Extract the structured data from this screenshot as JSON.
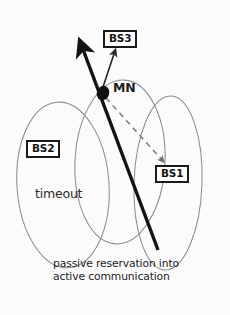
{
  "figure": {
    "type": "network-handover-diagram",
    "background_color": "#fbfbfb",
    "ink_color": "#1a1a1a",
    "cell_outline_color": "#8a8a8a",
    "width": 230,
    "height": 315
  },
  "nodes": {
    "mobile": {
      "label": "MN",
      "name": "mobile-node",
      "x": 103,
      "y": 93
    }
  },
  "base_stations": [
    {
      "label": "BS3",
      "name": "base-station-3",
      "box_x": 103,
      "box_y": 30
    },
    {
      "label": "BS2",
      "name": "base-station-2",
      "box_x": 26,
      "box_y": 140
    },
    {
      "label": "BS1",
      "name": "base-station-1",
      "box_x": 155,
      "box_y": 165
    }
  ],
  "cells": [
    {
      "name": "cell-bs2",
      "cx": 63,
      "cy": 185,
      "rx": 46,
      "ry": 83,
      "rotation": -4
    },
    {
      "name": "cell-bs3",
      "cx": 120,
      "cy": 162,
      "rx": 45,
      "ry": 82,
      "rotation": 3
    },
    {
      "name": "cell-bs1",
      "cx": 168,
      "cy": 183,
      "rx": 34,
      "ry": 87,
      "rotation": 2
    }
  ],
  "annotations": {
    "timeout": "timeout",
    "caption_line1": "passive reservation into",
    "caption_line2": "active communication"
  },
  "arrows": {
    "trajectory": {
      "name": "mn-trajectory-arrow",
      "style": "thick-solid",
      "from_x": 158,
      "from_y": 250,
      "to_x": 80,
      "to_y": 42
    },
    "active_link": {
      "name": "active-link-arrow-to-bs3",
      "style": "thin-solid",
      "from_x": 100,
      "from_y": 98,
      "to_x": 114,
      "to_y": 50
    },
    "passive_link": {
      "name": "passive-reservation-dashed-to-bs1",
      "style": "thin-dashed",
      "from_x": 105,
      "from_y": 97,
      "to_x": 162,
      "to_y": 160
    }
  },
  "bleed_through": {
    "note": "faint reverse-side page text visible in the scan"
  }
}
